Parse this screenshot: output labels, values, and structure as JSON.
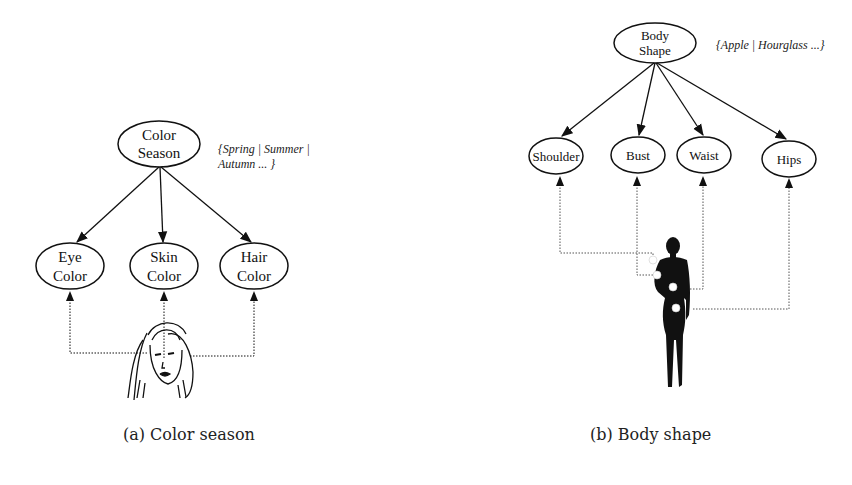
{
  "figure_a": {
    "root": {
      "line1": "Color",
      "line2": "Season"
    },
    "annotation": {
      "line1": "{Spring | Summer |",
      "line2": "Autumn ... }"
    },
    "children": [
      {
        "line1": "Eye",
        "line2": "Color"
      },
      {
        "line1": "Skin",
        "line2": "Color"
      },
      {
        "line1": "Hair",
        "line2": "Color"
      }
    ],
    "image": "woman-face-sketch",
    "caption": "(a) Color season"
  },
  "figure_b": {
    "root": {
      "line1": "Body",
      "line2": "Shape"
    },
    "annotation": "{Apple | Hourglass ...}",
    "children": [
      {
        "label": "Shoulder"
      },
      {
        "label": "Bust"
      },
      {
        "label": "Waist"
      },
      {
        "label": "Hips"
      }
    ],
    "image": "woman-body-silhouette",
    "caption": "(b) Body shape"
  },
  "colors": {
    "stroke": "#111111",
    "background": "#ffffff"
  }
}
